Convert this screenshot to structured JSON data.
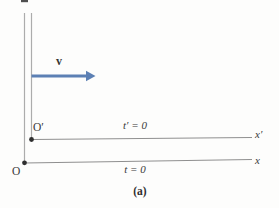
{
  "figure": {
    "caption": "(a)",
    "frame_s": {
      "origin_label": "O",
      "axis_label": "x",
      "time_label": "t = 0"
    },
    "frame_s_prime": {
      "origin_label": "O′",
      "axis_label": "x′",
      "time_label": "t′ = 0",
      "velocity_label": "v"
    },
    "colors": {
      "arrow_blue": "#5c80b4",
      "axis_gray": "#8f8f8f",
      "vertical_gray": "#acacac",
      "dot_black": "#2e2e2e",
      "crop_mark": "#4f4f4f"
    }
  }
}
